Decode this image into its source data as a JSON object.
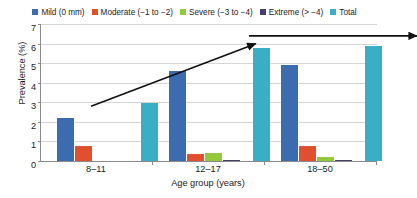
{
  "chart_data": {
    "type": "bar",
    "title": "",
    "xlabel": "Age group (years)",
    "ylabel": "Prevalence (%)",
    "categories": [
      "8–11",
      "12–17",
      "18–50"
    ],
    "ylim": [
      0,
      7
    ],
    "yticks": [
      0,
      1,
      2,
      3,
      4,
      5,
      6,
      7
    ],
    "grid": true,
    "legend_position": "top",
    "series": [
      {
        "name": "Mild (0 mm)",
        "color": "#3a6cae",
        "values": [
          2.2,
          4.6,
          4.9
        ]
      },
      {
        "name": "Moderate (−1 to −2)",
        "color": "#e04f2e",
        "values": [
          0.75,
          0.35,
          0.75
        ]
      },
      {
        "name": "Severe (−3 to −4)",
        "color": "#95c93d",
        "values": [
          0.0,
          0.4,
          0.18
        ]
      },
      {
        "name": "Extreme (> −4)",
        "color": "#4a3f6b",
        "values": [
          0.0,
          0.05,
          0.07
        ]
      },
      {
        "name": "Total",
        "color": "#3aafc4",
        "values": [
          2.95,
          5.75,
          5.9
        ]
      }
    ],
    "annotations": [
      {
        "name": "rising-trend-arrow",
        "from": [
          0.03,
          3.0
        ],
        "to": [
          0.52,
          6.2
        ],
        "style": "arrow"
      },
      {
        "name": "plateau-trend-arrow",
        "from": [
          0.5,
          6.6
        ],
        "to": [
          1.0,
          6.6
        ],
        "style": "arrow"
      }
    ]
  },
  "legend": {
    "entries": [
      {
        "label": "Mild (0 mm)",
        "color": "#3a6cae"
      },
      {
        "label": "Moderate (−1 to −2)",
        "color": "#e04f2e"
      },
      {
        "label": "Severe (−3 to −4)",
        "color": "#95c93d"
      },
      {
        "label": "Extreme (> −4)",
        "color": "#4a3f6b"
      },
      {
        "label": "Total",
        "color": "#3aafc4"
      }
    ]
  },
  "axes": {
    "ylabel": "Prevalence (%)",
    "xlabel": "Age group (years)",
    "ytick_labels": [
      "7",
      "6",
      "5",
      "4",
      "3",
      "2",
      "1",
      "0"
    ],
    "xtick_labels": [
      "8–11",
      "12–17",
      "18–50"
    ]
  }
}
